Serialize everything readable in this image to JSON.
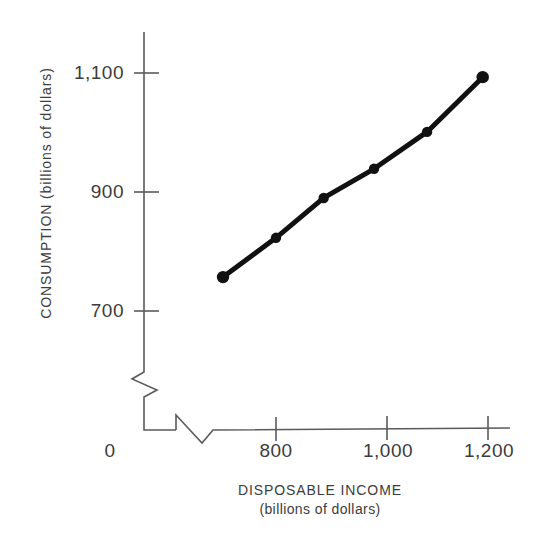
{
  "chart_data": {
    "type": "line",
    "title": "",
    "subtitle": "",
    "xlabel": "DISPOSABLE INCOME",
    "xlabel_units": "(billions of dollars)",
    "ylabel": "CONSUMPTION (billions of dollars)",
    "x": [
      700,
      800,
      890,
      985,
      1085,
      1190
    ],
    "values": [
      757,
      823,
      890,
      939,
      1001,
      1093
    ],
    "series": [
      {
        "name": "Consumption function",
        "x": [
          700,
          800,
          890,
          985,
          1085,
          1190
        ],
        "values": [
          757,
          823,
          890,
          939,
          1001,
          1093
        ]
      }
    ],
    "xticks": [
      0,
      800,
      1000,
      1200
    ],
    "xtick_labels": [
      "0",
      "800",
      "1,000",
      "1,200"
    ],
    "yticks": [
      700,
      900,
      1100
    ],
    "ytick_labels": [
      "700",
      "900",
      "1,100"
    ],
    "xlim": [
      660,
      1250
    ],
    "ylim": [
      660,
      1160
    ],
    "grid": false,
    "legend": false,
    "axis_break_x": true,
    "axis_break_y": true,
    "marker": "filled-circle",
    "line_color": "#111111",
    "marker_color": "#111111",
    "axis_color": "#555555",
    "background_color": "#ffffff"
  },
  "axes": {
    "origin_label": "0",
    "y_title": "CONSUMPTION (billions of dollars)",
    "x_title_line1": "DISPOSABLE INCOME",
    "x_title_line2": "(billions of dollars)",
    "x_tick_labels": [
      "800",
      "1,000",
      "1,200"
    ],
    "y_tick_labels": [
      "1,100",
      "900",
      "700"
    ]
  }
}
